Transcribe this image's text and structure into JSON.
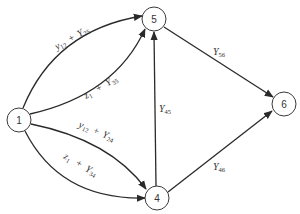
{
  "diagram": {
    "type": "directed-network",
    "nodes": [
      {
        "id": "1",
        "label": "1",
        "x": 19,
        "y": 120
      },
      {
        "id": "5",
        "label": "5",
        "x": 154,
        "y": 19
      },
      {
        "id": "4",
        "label": "4",
        "x": 157,
        "y": 198
      },
      {
        "id": "6",
        "label": "6",
        "x": 284,
        "y": 104
      }
    ],
    "edges": [
      {
        "from": "1",
        "to": "5",
        "label_main": "y",
        "label_sub1": "12",
        "label_plus": "+",
        "label_main2": "Y",
        "label_sub2": "25"
      },
      {
        "from": "1",
        "to": "5",
        "label_main": "z",
        "label_sub1": "1",
        "label_plus": "+",
        "label_main2": "Y",
        "label_sub2": "35"
      },
      {
        "from": "1",
        "to": "4",
        "label_main": "y",
        "label_sub1": "12",
        "label_plus": "+",
        "label_main2": "Y",
        "label_sub2": "24"
      },
      {
        "from": "1",
        "to": "4",
        "label_main": "z",
        "label_sub1": "1",
        "label_plus": "+",
        "label_main2": "Y",
        "label_sub2": "34"
      },
      {
        "from": "4",
        "to": "5",
        "label_main": "Y",
        "label_sub1": "45"
      },
      {
        "from": "5",
        "to": "6",
        "label_main": "Y",
        "label_sub1": "56"
      },
      {
        "from": "4",
        "to": "6",
        "label_main": "Y",
        "label_sub1": "46"
      }
    ],
    "colors": {
      "stroke": "#2a2a2a",
      "background": "#ffffff"
    }
  }
}
